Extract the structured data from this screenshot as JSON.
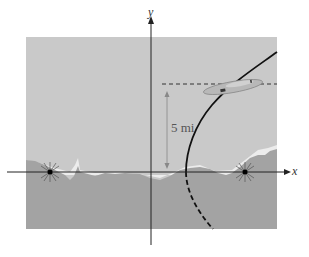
{
  "diagram": {
    "type": "hyperbola-navigation",
    "axes": {
      "x_label": "x",
      "y_label": "y"
    },
    "distance_label": "5 mi",
    "colors": {
      "sky": "#c9c9c9",
      "ground": "#a3a3a3",
      "snow": "#eeeeee",
      "curve": "#111111",
      "axis": "#222222",
      "plane": "#b5b5b5",
      "arrow": "#888888"
    },
    "elements": [
      "left focus transmitter",
      "right focus transmitter",
      "hyperbola branch (solid above x-axis, dashed below)",
      "airplane on curve",
      "dashed altitude line",
      "vertical distance arrow"
    ]
  }
}
